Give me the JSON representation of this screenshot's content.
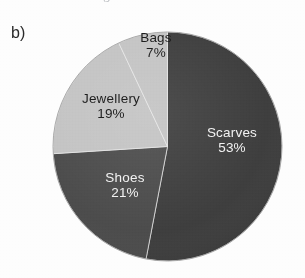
{
  "figure": {
    "panel_label": "b)",
    "cropped_caption": "showing how much was",
    "background_color": "#fdfdfd"
  },
  "chart_data": {
    "type": "pie",
    "title": "",
    "xlabel": "",
    "ylabel": "",
    "categories": [
      "Scarves",
      "Shoes",
      "Jewellery",
      "Bags"
    ],
    "values": [
      53,
      21,
      19,
      7
    ],
    "value_unit": "%",
    "labels": [
      "Scarves 53%",
      "Shoes 21%",
      "Jewellery 19%",
      "Bags 7%"
    ],
    "legend": "none",
    "grid": false,
    "start_angle_deg": 0,
    "direction": "clockwise",
    "slices": [
      {
        "name": "Scarves",
        "value": 53,
        "percent_text": "53%",
        "color": "#3a3a3a",
        "label_color": "#1e1e1e",
        "start_deg": 0,
        "end_deg": 190.8
      },
      {
        "name": "Shoes",
        "value": 21,
        "percent_text": "21%",
        "color": "#484848",
        "label_color": "#f2f2f2",
        "start_deg": 190.8,
        "end_deg": 266.4
      },
      {
        "name": "Jewellery",
        "value": 19,
        "percent_text": "19%",
        "color": "#c2c2c2",
        "label_color": "#1e1e1e",
        "start_deg": 266.4,
        "end_deg": 334.8
      },
      {
        "name": "Bags",
        "value": 7,
        "percent_text": "7%",
        "color": "#c2c2c2",
        "label_color": "#1e1e1e",
        "start_deg": 334.8,
        "end_deg": 360
      }
    ]
  }
}
